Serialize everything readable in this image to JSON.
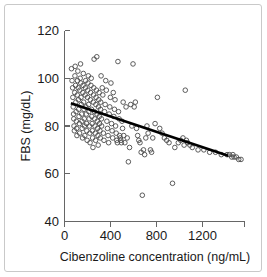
{
  "figure": {
    "kind": "scatter-plot-with-regression-line",
    "background_color": "#ffffff",
    "frame_color": "#c9c9c9"
  },
  "chart_data": {
    "type": "scatter",
    "title": "",
    "subtitle": "",
    "xlabel": "Cibenzoline concentration  (ng/mL)",
    "ylabel": "FBS  (mg/dL)",
    "xlim": [
      0,
      1550
    ],
    "ylim": [
      40,
      120
    ],
    "xticks": [
      0,
      400,
      800,
      1200
    ],
    "xtick_labels": [
      "0",
      "400",
      "800",
      "1200"
    ],
    "yticks": [
      40,
      60,
      80,
      100,
      120
    ],
    "ytick_labels": [
      "40",
      "60",
      "80",
      "100",
      "120"
    ],
    "grid": false,
    "legend": null,
    "legend_position": "none",
    "marker": {
      "style": "open-circle",
      "radius_px": 2.3,
      "edge_color": "#4b4b4b",
      "fill": "none"
    },
    "annotations": [],
    "series": [
      {
        "name": "Patients",
        "type": "scatter",
        "point_count": 196,
        "x": [
          60,
          65,
          70,
          72,
          75,
          78,
          80,
          82,
          85,
          88,
          90,
          92,
          95,
          98,
          100,
          102,
          105,
          107,
          110,
          112,
          115,
          118,
          120,
          122,
          125,
          128,
          130,
          132,
          135,
          138,
          140,
          142,
          145,
          148,
          150,
          152,
          155,
          158,
          160,
          162,
          165,
          168,
          170,
          172,
          175,
          178,
          180,
          182,
          185,
          188,
          190,
          192,
          195,
          198,
          200,
          202,
          205,
          208,
          210,
          212,
          215,
          218,
          220,
          222,
          225,
          228,
          230,
          232,
          235,
          238,
          240,
          242,
          245,
          248,
          250,
          252,
          255,
          258,
          260,
          262,
          265,
          268,
          270,
          272,
          275,
          278,
          280,
          282,
          285,
          288,
          290,
          292,
          295,
          298,
          300,
          302,
          305,
          308,
          310,
          312,
          315,
          318,
          320,
          325,
          330,
          335,
          340,
          345,
          350,
          355,
          360,
          365,
          370,
          375,
          380,
          385,
          390,
          395,
          400,
          405,
          410,
          415,
          420,
          425,
          430,
          435,
          440,
          445,
          450,
          455,
          460,
          465,
          470,
          475,
          480,
          485,
          490,
          495,
          500,
          505,
          510,
          520,
          530,
          540,
          550,
          560,
          570,
          580,
          590,
          600,
          610,
          620,
          630,
          640,
          650,
          660,
          670,
          680,
          690,
          700,
          710,
          720,
          740,
          750,
          760,
          780,
          800,
          820,
          840,
          860,
          880,
          900,
          930,
          950,
          980,
          1000,
          1020,
          1030,
          1040,
          1050,
          1060,
          1080,
          1100,
          1150,
          1200,
          1250,
          1300,
          1350,
          1400,
          1420,
          1440,
          1450,
          1460,
          1480,
          1500,
          1520
        ],
        "y": [
          104,
          99,
          96,
          92,
          88,
          85,
          83,
          80,
          78,
          94,
          101,
          105,
          97,
          90,
          86,
          82,
          79,
          76,
          93,
          99,
          103,
          96,
          91,
          87,
          84,
          81,
          77,
          95,
          100,
          106,
          98,
          92,
          89,
          85,
          82,
          79,
          75,
          94,
          97,
          102,
          90,
          87,
          83,
          80,
          76,
          93,
          96,
          99,
          88,
          85,
          81,
          78,
          74,
          92,
          95,
          98,
          101,
          89,
          86,
          83,
          80,
          77,
          73,
          91,
          94,
          97,
          100,
          87,
          84,
          81,
          78,
          75,
          71,
          90,
          93,
          96,
          108,
          86,
          83,
          80,
          77,
          74,
          89,
          92,
          95,
          109,
          85,
          82,
          79,
          76,
          72,
          88,
          91,
          94,
          84,
          81,
          78,
          75,
          87,
          90,
          101,
          83,
          80,
          96,
          93,
          77,
          74,
          86,
          89,
          99,
          95,
          82,
          79,
          76,
          73,
          85,
          88,
          92,
          98,
          81,
          78,
          75,
          94,
          84,
          87,
          91,
          80,
          77,
          74,
          73,
          107,
          86,
          83,
          76,
          75,
          74,
          73,
          82,
          79,
          90,
          76,
          73,
          88,
          75,
          65,
          71,
          89,
          80,
          106,
          88,
          90,
          79,
          76,
          74,
          73,
          69,
          51,
          70,
          68,
          75,
          80,
          77,
          70,
          69,
          75,
          81,
          92,
          79,
          77,
          75,
          74,
          73,
          56,
          71,
          73,
          74,
          75,
          72,
          95,
          74,
          73,
          72,
          71,
          70,
          70,
          69,
          69,
          68,
          68,
          68,
          67,
          68,
          67,
          67,
          66,
          66
        ]
      }
    ],
    "fit_line": {
      "name": "linear regression",
      "type": "line",
      "x": [
        55,
        1410
      ],
      "y": [
        89.5,
        67.5
      ],
      "color": "#000000",
      "width_px": 2.6
    }
  }
}
